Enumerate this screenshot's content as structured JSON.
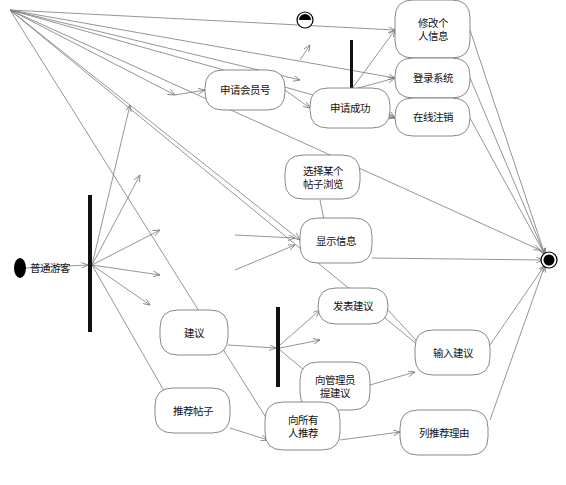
{
  "diagram": {
    "type": "uml-activity",
    "colors": {
      "line": "#7a7a7a",
      "node_border": "#6a6a6a",
      "bar": "#111111",
      "text": "#111111",
      "background": "#ffffff"
    },
    "start": {
      "id": "start",
      "label": "普通游客",
      "x": 20,
      "y": 268
    },
    "end": {
      "id": "end",
      "x": 549,
      "y": 260
    },
    "top_marker": {
      "id": "top-final",
      "x": 305,
      "y": 20
    },
    "bars": [
      {
        "id": "fork-main",
        "x": 88,
        "y": 195,
        "w": 4,
        "h": 137
      },
      {
        "id": "fork-top",
        "x": 350,
        "y": 40,
        "w": 3,
        "h": 85
      },
      {
        "id": "fork-suggest",
        "x": 276,
        "y": 307,
        "w": 4,
        "h": 80
      }
    ],
    "nodes": [
      {
        "id": "apply-member",
        "lines": [
          "申请会员号"
        ],
        "x": 205,
        "y": 70,
        "w": 80,
        "h": 40
      },
      {
        "id": "apply-success",
        "lines": [
          "申请成功"
        ],
        "x": 310,
        "y": 88,
        "w": 80,
        "h": 40
      },
      {
        "id": "edit-info",
        "lines": [
          "修改个",
          "人信息"
        ],
        "x": 395,
        "y": 0,
        "w": 75,
        "h": 58
      },
      {
        "id": "login",
        "lines": [
          "登录系统"
        ],
        "x": 395,
        "y": 58,
        "w": 75,
        "h": 40
      },
      {
        "id": "logout",
        "lines": [
          "在线注销"
        ],
        "x": 395,
        "y": 98,
        "w": 75,
        "h": 38
      },
      {
        "id": "choose-post",
        "lines": [
          "选择某个",
          "帖子浏览"
        ],
        "x": 285,
        "y": 155,
        "w": 75,
        "h": 44
      },
      {
        "id": "show-info",
        "lines": [
          "显示信息"
        ],
        "x": 300,
        "y": 218,
        "w": 72,
        "h": 45
      },
      {
        "id": "suggest",
        "lines": [
          "建议"
        ],
        "x": 160,
        "y": 310,
        "w": 68,
        "h": 45
      },
      {
        "id": "post-suggest",
        "lines": [
          "发表建议"
        ],
        "x": 318,
        "y": 288,
        "w": 70,
        "h": 36
      },
      {
        "id": "input-suggest",
        "lines": [
          "输入建议"
        ],
        "x": 415,
        "y": 330,
        "w": 75,
        "h": 45
      },
      {
        "id": "suggest-admin",
        "lines": [
          "向管理员",
          "提建议"
        ],
        "x": 300,
        "y": 362,
        "w": 70,
        "h": 48
      },
      {
        "id": "recommend-post",
        "lines": [
          "推荐帖子"
        ],
        "x": 155,
        "y": 388,
        "w": 75,
        "h": 45
      },
      {
        "id": "recommend-all",
        "lines": [
          "向所有",
          "人推荐"
        ],
        "x": 265,
        "y": 402,
        "w": 75,
        "h": 48
      },
      {
        "id": "recommend-reason",
        "lines": [
          "列推荐理由"
        ],
        "x": 400,
        "y": 410,
        "w": 88,
        "h": 45
      }
    ],
    "edges": [
      {
        "from": [
          10,
          10
        ],
        "to": [
          395,
          30
        ]
      },
      {
        "from": [
          10,
          10
        ],
        "to": [
          395,
          78
        ]
      },
      {
        "from": [
          10,
          10
        ],
        "to": [
          395,
          118
        ]
      },
      {
        "from": [
          10,
          10
        ],
        "to": [
          300,
          80
        ]
      },
      {
        "from": [
          10,
          10
        ],
        "to": [
          540,
          250
        ]
      },
      {
        "from": [
          10,
          10
        ],
        "to": [
          300,
          240
        ]
      },
      {
        "from": [
          10,
          10
        ],
        "to": [
          430,
          355
        ]
      },
      {
        "from": [
          10,
          10
        ],
        "to": [
          280,
          440
        ]
      },
      {
        "from": [
          10,
          10
        ],
        "to": [
          175,
          95
        ]
      },
      {
        "from": [
          26,
          268
        ],
        "to": [
          88,
          265
        ]
      },
      {
        "from": [
          92,
          265
        ],
        "to": [
          130,
          105
        ]
      },
      {
        "from": [
          92,
          265
        ],
        "to": [
          140,
          175
        ]
      },
      {
        "from": [
          92,
          265
        ],
        "to": [
          160,
          230
        ]
      },
      {
        "from": [
          92,
          265
        ],
        "to": [
          160,
          275
        ]
      },
      {
        "from": [
          92,
          265
        ],
        "to": [
          150,
          305
        ]
      },
      {
        "from": [
          92,
          265
        ],
        "to": [
          175,
          410
        ]
      },
      {
        "from": [
          175,
          95
        ],
        "to": [
          205,
          90
        ]
      },
      {
        "from": [
          285,
          90
        ],
        "to": [
          310,
          108
        ]
      },
      {
        "from": [
          351,
          90
        ],
        "to": [
          395,
          30
        ]
      },
      {
        "from": [
          351,
          90
        ],
        "to": [
          395,
          78
        ]
      },
      {
        "from": [
          351,
          90
        ],
        "to": [
          395,
          118
        ]
      },
      {
        "from": [
          300,
          60
        ],
        "to": [
          310,
          45
        ]
      },
      {
        "from": [
          470,
          30
        ],
        "to": [
          545,
          255
        ]
      },
      {
        "from": [
          470,
          78
        ],
        "to": [
          545,
          255
        ]
      },
      {
        "from": [
          470,
          118
        ],
        "to": [
          545,
          255
        ]
      },
      {
        "from": [
          372,
          258
        ],
        "to": [
          543,
          260
        ]
      },
      {
        "from": [
          320,
          200
        ],
        "to": [
          325,
          225
        ]
      },
      {
        "from": [
          235,
          235
        ],
        "to": [
          295,
          238
        ]
      },
      {
        "from": [
          235,
          270
        ],
        "to": [
          295,
          245
        ]
      },
      {
        "from": [
          228,
          345
        ],
        "to": [
          276,
          348
        ]
      },
      {
        "from": [
          280,
          345
        ],
        "to": [
          320,
          310
        ]
      },
      {
        "from": [
          280,
          348
        ],
        "to": [
          320,
          340
        ]
      },
      {
        "from": [
          280,
          350
        ],
        "to": [
          310,
          375
        ]
      },
      {
        "from": [
          388,
          310
        ],
        "to": [
          425,
          350
        ]
      },
      {
        "from": [
          370,
          385
        ],
        "to": [
          415,
          372
        ]
      },
      {
        "from": [
          490,
          345
        ],
        "to": [
          545,
          265
        ]
      },
      {
        "from": [
          490,
          420
        ],
        "to": [
          545,
          265
        ]
      },
      {
        "from": [
          230,
          428
        ],
        "to": [
          268,
          440
        ]
      },
      {
        "from": [
          340,
          440
        ],
        "to": [
          400,
          432
        ]
      },
      {
        "from": [
          440,
          410
        ],
        "to": [
          400,
          440
        ]
      }
    ]
  }
}
